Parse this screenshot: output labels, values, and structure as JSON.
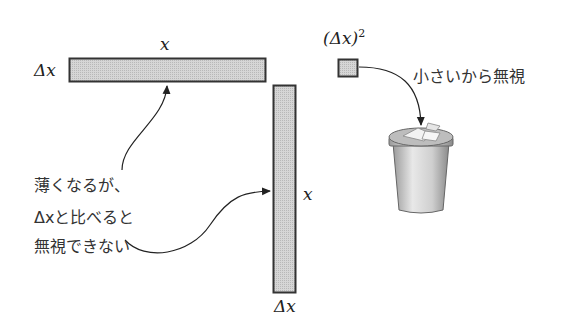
{
  "labels": {
    "top_bar_length": "x",
    "top_bar_width": "Δx",
    "side_bar_length": "x",
    "side_bar_width": "Δx",
    "square_label_base": "(Δx)",
    "square_label_exp": "2"
  },
  "annotations": {
    "square_note": "小さいから無視",
    "strip_note_lines": [
      "薄くなるが、",
      "Δxと比べると",
      "無視できない"
    ]
  },
  "colors": {
    "fill": "#cfcfcf",
    "stroke": "#333333"
  }
}
